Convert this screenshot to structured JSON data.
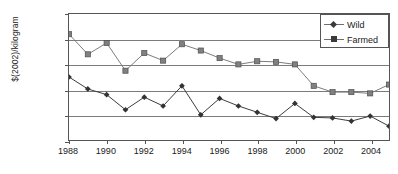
{
  "chart_data": {
    "type": "line",
    "title": "",
    "xlabel": "",
    "ylabel": "$(2002)/kilogram",
    "ylim": [
      0,
      10
    ],
    "ytick_step": 2,
    "ytick_labels": [
      "0.00",
      "2.00",
      "4.00",
      "6.00",
      "8.00",
      "10.00"
    ],
    "xlim": [
      1988,
      2005
    ],
    "xtick_labels": [
      "1988",
      "1990",
      "1992",
      "1994",
      "1996",
      "1998",
      "2000",
      "2002",
      "2004"
    ],
    "x": [
      1988,
      1989,
      1990,
      1991,
      1992,
      1993,
      1994,
      1995,
      1996,
      1997,
      1998,
      1999,
      2000,
      2001,
      2002,
      2003,
      2004,
      2005
    ],
    "grid": true,
    "legend_position": "top-right",
    "series": [
      {
        "name": "Wild",
        "marker": "diamond",
        "color": "#3a3a3a",
        "values": [
          5.0,
          4.05,
          3.6,
          2.4,
          3.4,
          2.7,
          4.3,
          2.0,
          3.3,
          2.7,
          2.2,
          1.7,
          2.9,
          1.8,
          1.75,
          1.5,
          1.9,
          1.1
        ]
      },
      {
        "name": "Farmed",
        "marker": "square",
        "color": "#7a7a7a",
        "values": [
          8.4,
          6.8,
          7.7,
          5.5,
          6.9,
          6.3,
          7.6,
          7.1,
          6.5,
          6.0,
          6.25,
          6.2,
          6.0,
          4.3,
          3.8,
          3.8,
          3.7,
          4.4
        ]
      }
    ]
  },
  "legend": {
    "items": [
      {
        "label": "Wild"
      },
      {
        "label": "Farmed"
      }
    ]
  }
}
